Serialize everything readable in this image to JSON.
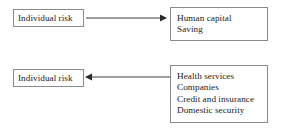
{
  "diagram": {
    "colors": {
      "border": "#8a8a8a",
      "text": "#1c1c1c",
      "arrow": "#3d3d3d",
      "background": "#ffffff"
    },
    "rows": [
      {
        "id": "top",
        "source_label": "Individual risk",
        "arrow_direction": "right",
        "target_lines": [
          "Human capital",
          "Saving"
        ]
      },
      {
        "id": "bottom",
        "source_label": "Individual risk",
        "arrow_direction": "left",
        "target_lines": [
          "Health services",
          "Companies",
          "Credit and insurance",
          "Domestic security"
        ]
      }
    ]
  }
}
